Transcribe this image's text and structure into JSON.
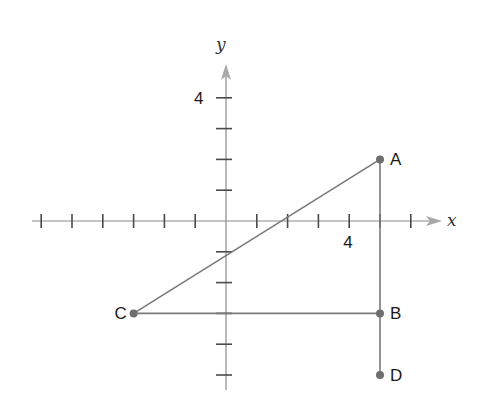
{
  "diagram": {
    "type": "coordinate-plane",
    "axes": {
      "x_label": "x",
      "y_label": "y",
      "x_range": [
        -6,
        6
      ],
      "y_range": [
        -5,
        5
      ],
      "x_tick_label": {
        "value": 4,
        "text": "4"
      },
      "y_tick_label": {
        "value": 4,
        "text": "4"
      }
    },
    "points": [
      {
        "name": "A",
        "label": "A",
        "x": 5,
        "y": 2
      },
      {
        "name": "B",
        "label": "B",
        "x": 5,
        "y": -3
      },
      {
        "name": "C",
        "label": "C",
        "x": -3,
        "y": -3
      },
      {
        "name": "D",
        "label": "D",
        "x": 5,
        "y": -5
      }
    ],
    "segments": [
      [
        "A",
        "C"
      ],
      [
        "C",
        "B"
      ],
      [
        "A",
        "D"
      ]
    ],
    "colors": {
      "line": "#7a7a7a",
      "point": "#6e6e6e",
      "axis": "#8a8a8a",
      "arrow": "#a8a8a8"
    }
  }
}
